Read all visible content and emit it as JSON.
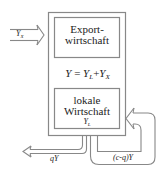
{
  "diagram": {
    "export_box": {
      "line1": "Export-",
      "line2": "wirtschaft"
    },
    "equation": {
      "lhs": "Y",
      "eq": " = ",
      "t1": "Y",
      "t1_sub": "L",
      "plus": "+",
      "t2": "Y",
      "t2_sub": "X"
    },
    "local_box": {
      "line1": "lokale",
      "line2": "Wirtschaft",
      "var": "Y",
      "var_sub": "L"
    },
    "input_arrow": {
      "label": "Y",
      "label_sub": "X"
    },
    "leak_arrow": {
      "label": "qY"
    },
    "feedback_arrow": {
      "label": "(c-q)Y"
    },
    "colors": {
      "line": "#888888",
      "text": "#222222",
      "background": "#ffffff"
    }
  }
}
